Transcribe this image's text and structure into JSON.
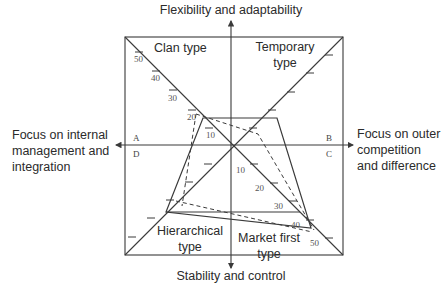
{
  "axes": {
    "top": "Flexibility and adaptability",
    "bottom": "Stability and control",
    "left": [
      "Focus on internal",
      "management and",
      "integration"
    ],
    "right": [
      "Focus on outer",
      "competition",
      "and difference"
    ]
  },
  "quadrants": {
    "top_left": "Clan type",
    "top_right": [
      "Temporary",
      "type"
    ],
    "bottom_left": [
      "Hierarchical",
      "type"
    ],
    "bottom_right": [
      "Market first",
      "type"
    ]
  },
  "corner_letters": {
    "A": "A",
    "B": "B",
    "C": "C",
    "D": "D"
  },
  "scale_ticks": {
    "upper_left_diagonal": [
      "50",
      "40",
      "30",
      "20",
      "10"
    ],
    "lower_right_diagonal": [
      "10",
      "20",
      "30",
      "40",
      "50"
    ]
  },
  "profiles": {
    "solid": {
      "style": "solid",
      "points": [
        [
          203,
          118
        ],
        [
          277,
          118
        ],
        [
          311,
          228
        ],
        [
          166,
          212
        ]
      ]
    },
    "dashed": {
      "style": "dashed"
    }
  },
  "colors": {
    "line": "#3a3a3a",
    "text": "#2b2b2b",
    "background": "#ffffff"
  }
}
